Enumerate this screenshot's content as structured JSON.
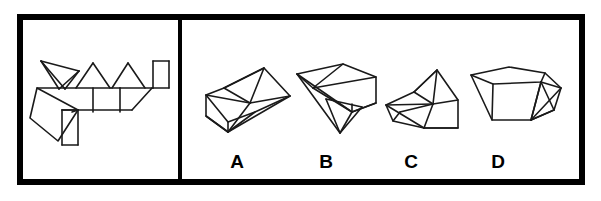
{
  "figure": {
    "name": "spatial-reasoning-net-and-solids",
    "type": "line-art-diagram",
    "colors": {
      "background": "#ffffff",
      "ink": "#1a1a1a",
      "border": "#000000",
      "label": "#000000"
    },
    "border": {
      "x": 17,
      "y": 14,
      "width": 568,
      "height": 171,
      "stroke_width": 6
    },
    "divider": {
      "x": 180,
      "y_top": 14,
      "y_bottom": 185,
      "stroke_width": 4
    }
  },
  "left_panel": {
    "name": "net-panel",
    "label": "",
    "net": {
      "name": "unfolded-net",
      "stroke_width": 1.6,
      "paths": [
        "M 37,88 L 120,88",
        "M 120,88 L 153,88",
        "M 37,88 L 30,118 L 58,141 L 78,110 L 37,88",
        "M 78,110 L 72,112",
        "M 41,61 L 65,89",
        "M 41,61 L 79,71",
        "M 79,71 L 59,89",
        "M 41,61 L 59,89",
        "M 79,71 L 65,89",
        "M 93,63 L 76,88",
        "M 93,63 L 110,88",
        "M 128,63 L 112,88",
        "M 128,63 L 145,88",
        "M 120,88 L 120,112",
        "M 93,88 L 93,112",
        "M 62,110 L 120,110",
        "M 62,110 L 62,145",
        "M 62,110 L 78,110",
        "M 78,145 L 78,110",
        "M 62,145 L 78,145",
        "M 120,110 L 132,110",
        "M 132,110 L 152,88",
        "M 153,88 L 153,61",
        "M 153,88 L 169,88",
        "M 153,61 L 169,61",
        "M 169,61 L 169,88"
      ]
    }
  },
  "right_panel": {
    "name": "options-panel",
    "options": [
      {
        "id": "A",
        "label": "A",
        "name": "option-a",
        "label_x": 237,
        "label_y": 168,
        "shape_name": "boat-like-solid-a",
        "stroke_width": 1.6,
        "paths": [
          "M 206,95 L 224,88 L 264,68 L 290,96 L 255,112 L 228,122 L 206,95",
          "M 206,95 L 206,116 L 228,132 L 255,112",
          "M 228,122 L 228,132",
          "M 206,116 L 228,132",
          "M 264,68 L 250,103 L 290,96",
          "M 264,68 L 224,88",
          "M 224,88 L 250,103",
          "M 250,103 L 228,132",
          "M 250,103 L 206,95",
          "M 290,96 L 228,132"
        ]
      },
      {
        "id": "B",
        "label": "B",
        "name": "option-b",
        "label_x": 326,
        "label_y": 168,
        "shape_name": "wedge-solid-b",
        "stroke_width": 1.6,
        "paths": [
          "M 297,74 L 343,64 L 376,77 L 376,103 L 352,112 L 297,74",
          "M 343,64 L 313,88 L 376,77",
          "M 297,74 L 313,88",
          "M 313,88 L 352,112",
          "M 352,112 L 352,104",
          "M 326,99 L 340,133 L 362,107",
          "M 326,99 L 362,107",
          "M 340,133 L 352,112",
          "M 352,112 L 376,103",
          "M 297,74 L 340,133"
        ]
      },
      {
        "id": "C",
        "label": "C",
        "name": "option-c",
        "label_x": 411,
        "label_y": 168,
        "shape_name": "boat-like-solid-c",
        "stroke_width": 1.6,
        "paths": [
          "M 386,105 L 414,92 L 437,70 L 458,100 L 458,128 L 424,128 L 386,105",
          "M 437,70 L 414,92",
          "M 437,70 L 433,104",
          "M 414,92 L 433,104",
          "M 433,104 L 458,100",
          "M 386,105 L 433,104",
          "M 386,105 L 393,121 L 424,128",
          "M 393,121 L 400,112",
          "M 400,112 L 433,104",
          "M 424,128 L 458,128",
          "M 433,104 L 424,128"
        ]
      },
      {
        "id": "D",
        "label": "D",
        "name": "option-d",
        "label_x": 498,
        "label_y": 168,
        "shape_name": "faceted-solid-d",
        "stroke_width": 1.6,
        "paths": [
          "M 471,75 L 509,67 L 545,73 L 561,88 L 554,110 L 531,120 L 492,120 L 471,75",
          "M 471,75 L 493,84 L 541,82 L 545,73",
          "M 493,84 L 492,120",
          "M 541,82 L 531,120",
          "M 541,82 L 561,88",
          "M 541,82 L 554,110",
          "M 531,120 L 554,110",
          "M 561,88 L 531,120",
          "M 541,82 L 531,120"
        ]
      }
    ]
  }
}
